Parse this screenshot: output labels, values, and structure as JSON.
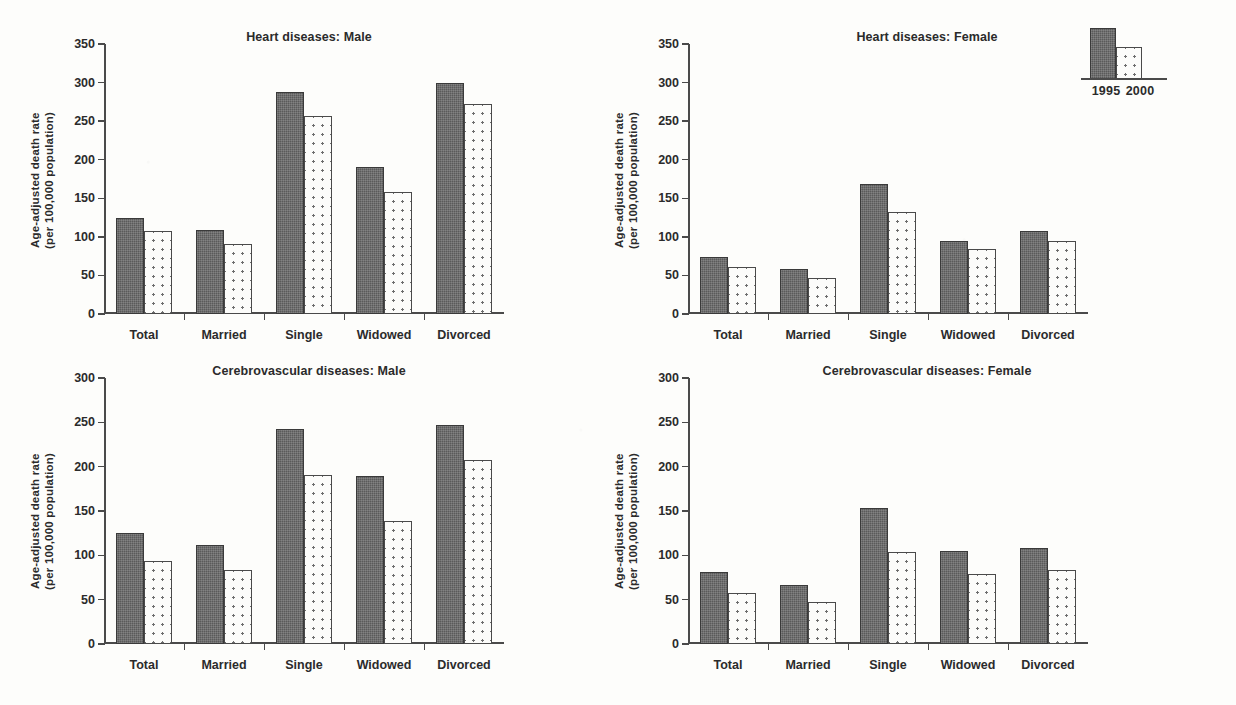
{
  "figure": {
    "ylabel_line1": "Age-adjusted death rate",
    "ylabel_line2": "(per 100,000 population)",
    "categories": [
      "Total",
      "Married",
      "Single",
      "Widowed",
      "Divorced"
    ],
    "legend": {
      "series_1_label": "1995",
      "series_2_label": "2000",
      "series_1_color": "#5a5a5a",
      "series_2_color": "#fcfcfa"
    }
  },
  "chart_data": [
    {
      "type": "bar",
      "title": "Heart diseases: Male",
      "xlabel": "",
      "ylabel": "Age-adjusted death rate (per 100,000 population)",
      "categories": [
        "Total",
        "Married",
        "Single",
        "Widowed",
        "Divorced"
      ],
      "series": [
        {
          "name": "1995",
          "values": [
            125,
            109,
            288,
            190,
            299
          ]
        },
        {
          "name": "2000",
          "values": [
            108,
            91,
            257,
            158,
            272
          ]
        }
      ],
      "ylim": [
        0,
        350
      ],
      "yticks": [
        0,
        50,
        100,
        150,
        200,
        250,
        300,
        350
      ],
      "grid": false,
      "legend_position": "none"
    },
    {
      "type": "bar",
      "title": "Heart diseases: Female",
      "xlabel": "",
      "ylabel": "Age-adjusted death rate (per 100,000 population)",
      "categories": [
        "Total",
        "Married",
        "Single",
        "Widowed",
        "Divorced"
      ],
      "series": [
        {
          "name": "1995",
          "values": [
            74,
            58,
            168,
            95,
            108
          ]
        },
        {
          "name": "2000",
          "values": [
            61,
            47,
            132,
            84,
            95
          ]
        }
      ],
      "ylim": [
        0,
        350
      ],
      "yticks": [
        0,
        50,
        100,
        150,
        200,
        250,
        300,
        350
      ],
      "grid": false,
      "legend_position": "top-right"
    },
    {
      "type": "bar",
      "title": "Cerebrovascular diseases: Male",
      "xlabel": "",
      "ylabel": "Age-adjusted death rate (per 100,000 population)",
      "categories": [
        "Total",
        "Married",
        "Single",
        "Widowed",
        "Divorced"
      ],
      "series": [
        {
          "name": "1995",
          "values": [
            125,
            112,
            242,
            190,
            247
          ]
        },
        {
          "name": "2000",
          "values": [
            94,
            83,
            191,
            139,
            207
          ]
        }
      ],
      "ylim": [
        0,
        300
      ],
      "yticks": [
        0,
        50,
        100,
        150,
        200,
        250,
        300
      ],
      "grid": false,
      "legend_position": "none"
    },
    {
      "type": "bar",
      "title": "Cerebrovascular diseases: Female",
      "xlabel": "",
      "ylabel": "Age-adjusted death rate (per 100,000 population)",
      "categories": [
        "Total",
        "Married",
        "Single",
        "Widowed",
        "Divorced"
      ],
      "series": [
        {
          "name": "1995",
          "values": [
            81,
            66,
            153,
            105,
            108
          ]
        },
        {
          "name": "2000",
          "values": [
            57,
            47,
            104,
            79,
            84
          ]
        }
      ],
      "ylim": [
        0,
        300
      ],
      "yticks": [
        0,
        50,
        100,
        150,
        200,
        250,
        300
      ],
      "grid": false,
      "legend_position": "none"
    }
  ]
}
